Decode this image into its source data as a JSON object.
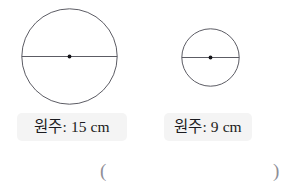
{
  "figures": [
    {
      "id": "large-circle",
      "shape_name": "circle",
      "center_mark": "center-point-dot",
      "diameter_mark": "diameter-line",
      "label": "원주: 15 cm",
      "measure_name": "원주",
      "value": 15,
      "unit": "cm"
    },
    {
      "id": "small-circle",
      "shape_name": "circle",
      "center_mark": "center-point-dot",
      "diameter_mark": "diameter-line",
      "label": "원주: 9 cm",
      "measure_name": "원주",
      "value": 9,
      "unit": "cm"
    }
  ],
  "answer": {
    "open_paren": "(",
    "close_paren": ")",
    "value": ""
  },
  "colors": {
    "background": "#ffffff",
    "stroke": "#4a4a52",
    "dot": "#15151a",
    "label_background": "#f4f4f4",
    "label_text": "#1c1c20",
    "paren_text": "#8e8e96"
  }
}
